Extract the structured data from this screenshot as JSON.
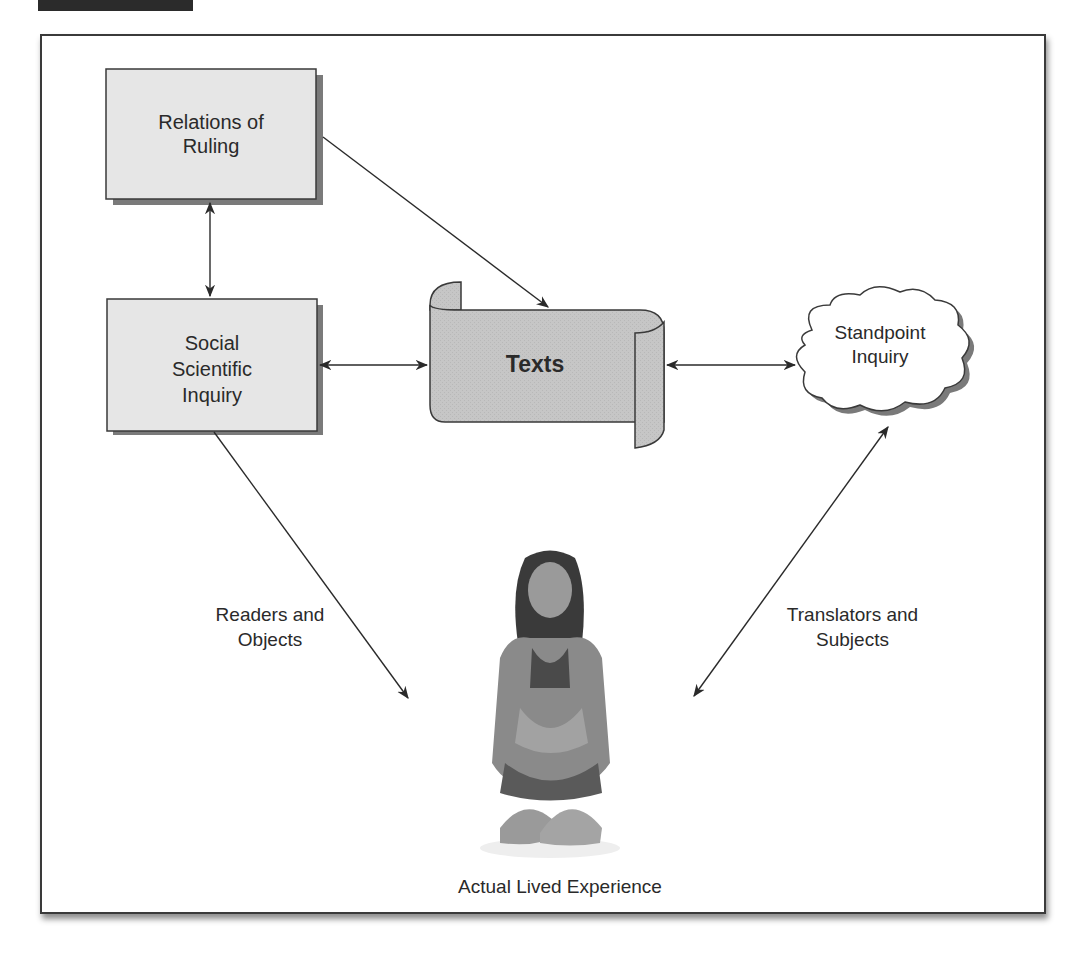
{
  "figure": {
    "frame": {
      "border_color": "#3a3a3a",
      "background": "#ffffff"
    },
    "header_tab_color": "#2b2b2b"
  },
  "nodes": {
    "relations_of_ruling": {
      "label": "Relations of Ruling",
      "line1": "Relations of",
      "line2": "Ruling",
      "shape": "shadowed-rectangle",
      "fill": "#e4e4e4"
    },
    "social_scientific_inquiry": {
      "label": "Social Scientific Inquiry",
      "line1": "Social",
      "line2": "Scientific",
      "line3": "Inquiry",
      "shape": "shadowed-rectangle",
      "fill": "#e4e4e4"
    },
    "texts": {
      "label": "Texts",
      "shape": "scroll",
      "fill": "#c4c4c4"
    },
    "standpoint_inquiry": {
      "label": "Standpoint Inquiry",
      "line1": "Standpoint",
      "line2": "Inquiry",
      "shape": "cloud",
      "fill": "#ffffff"
    },
    "actual_lived_experience": {
      "label": "Actual Lived Experience",
      "shape": "photo-of-person"
    }
  },
  "edges": [
    {
      "from": "relations_of_ruling",
      "to": "social_scientific_inquiry",
      "direction": "bidirectional"
    },
    {
      "from": "relations_of_ruling",
      "to": "texts",
      "direction": "forward"
    },
    {
      "from": "social_scientific_inquiry",
      "to": "texts",
      "direction": "bidirectional"
    },
    {
      "from": "texts",
      "to": "standpoint_inquiry",
      "direction": "bidirectional"
    },
    {
      "from": "social_scientific_inquiry",
      "to": "actual_lived_experience",
      "direction": "forward",
      "label": "Readers and Objects"
    },
    {
      "from": "standpoint_inquiry",
      "to": "actual_lived_experience",
      "direction": "bidirectional",
      "label": "Translators and Subjects"
    }
  ],
  "edge_labels": {
    "readers": {
      "line1": "Readers and",
      "line2": "Objects"
    },
    "translators": {
      "line1": "Translators and",
      "line2": "Subjects"
    }
  },
  "caption": "Actual Lived Experience"
}
